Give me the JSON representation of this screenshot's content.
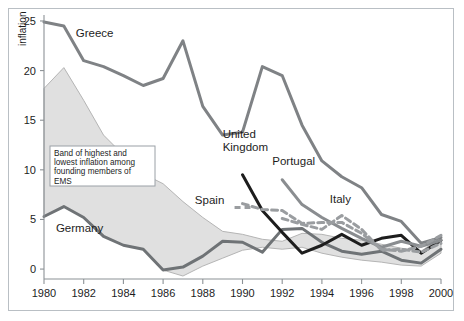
{
  "figure": {
    "background": "#ffffff",
    "frame_color": "#b9bfc4",
    "axis_color": "#8c9296"
  },
  "chart_data": {
    "type": "line",
    "title": "",
    "xlabel": "",
    "ylabel": "inflation",
    "xlim": [
      1980,
      2000
    ],
    "ylim": [
      -1,
      25.5
    ],
    "yticks": [
      0,
      5,
      10,
      15,
      20,
      25
    ],
    "xticks": [
      1980,
      1982,
      1984,
      1986,
      1988,
      1990,
      1992,
      1994,
      1996,
      1998,
      2000
    ],
    "ytick_labels": [
      "0",
      "5",
      "10",
      "15",
      "20",
      "25"
    ],
    "xtick_labels": [
      "1980",
      "1982",
      "1984",
      "1986",
      "1988",
      "1990",
      "1992",
      "1994",
      "1996",
      "1998",
      "2000"
    ],
    "grid": false,
    "legend_position": "inline-annotations",
    "x": [
      1980,
      1981,
      1982,
      1983,
      1984,
      1985,
      1986,
      1987,
      1988,
      1989,
      1990,
      1991,
      1992,
      1993,
      1994,
      1995,
      1996,
      1997,
      1998,
      1999,
      2000
    ],
    "band": {
      "name": "Band of highest and lowest inflation among founding members of EMS",
      "fill": "#e0e0e0",
      "edge": "#b5b5b5",
      "upper": [
        18.2,
        20.3,
        17.0,
        13.5,
        11.5,
        9.6,
        8.6,
        6.8,
        5.2,
        3.8,
        3.5,
        3.0,
        2.8,
        3.6,
        3.5,
        3.1,
        2.9,
        2.5,
        2.1,
        1.8,
        3.2
      ],
      "lower": [
        5.3,
        6.3,
        5.2,
        3.3,
        2.4,
        2.0,
        -0.1,
        -0.7,
        0.3,
        1.1,
        1.9,
        2.2,
        2.0,
        2.2,
        1.6,
        1.2,
        0.9,
        0.7,
        0.4,
        0.3,
        1.6
      ]
    },
    "series": [
      {
        "name": "Greece",
        "style": "solid",
        "color": "#7f8285",
        "width": 3.0,
        "label_x": 1981.6,
        "label_y": 23.4,
        "values": [
          24.9,
          24.5,
          21.0,
          20.4,
          19.5,
          18.5,
          19.2,
          23.0,
          16.4,
          13.5,
          13.8,
          20.4,
          19.5,
          14.5,
          10.9,
          9.3,
          8.2,
          5.5,
          4.8,
          2.6,
          3.2
        ]
      },
      {
        "name": "Germany",
        "style": "solid",
        "color": "#6f7376",
        "width": 3.0,
        "label_x": 1980.6,
        "label_y": 3.7,
        "values": [
          5.3,
          6.3,
          5.2,
          3.3,
          2.4,
          2.0,
          -0.1,
          0.2,
          1.3,
          2.8,
          2.7,
          1.7,
          4.0,
          4.1,
          2.7,
          1.8,
          1.5,
          1.8,
          0.9,
          0.6,
          2.0
        ]
      },
      {
        "name": "United Kingdom",
        "style": "solid",
        "color": "#1d1d1d",
        "width": 3.0,
        "label_x": 1989.0,
        "label_y": 13.2,
        "values": [
          null,
          null,
          null,
          null,
          null,
          null,
          null,
          null,
          null,
          null,
          9.5,
          5.9,
          3.7,
          1.6,
          2.4,
          3.5,
          2.4,
          3.1,
          3.4,
          1.6,
          2.9
        ]
      },
      {
        "name": "Portugal",
        "style": "solid",
        "color": "#8a8d90",
        "width": 3.0,
        "label_x": 1991.5,
        "label_y": 10.5,
        "values": [
          null,
          null,
          null,
          null,
          null,
          null,
          null,
          null,
          null,
          null,
          null,
          null,
          9.0,
          6.5,
          5.2,
          4.1,
          3.1,
          2.2,
          2.8,
          2.3,
          2.9
        ]
      },
      {
        "name": "Spain",
        "style": "dashed",
        "color": "#9a9da0",
        "width": 3.0,
        "label_x": 1987.6,
        "label_y": 6.6,
        "values": [
          null,
          null,
          null,
          null,
          null,
          null,
          null,
          null,
          null,
          null,
          6.6,
          6.0,
          5.9,
          4.6,
          4.7,
          4.7,
          3.6,
          2.0,
          1.8,
          2.3,
          3.4
        ]
      },
      {
        "name": "Italy",
        "style": "dashed",
        "color": "#9a9da0",
        "width": 3.0,
        "label_x": 1994.4,
        "label_y": 6.7,
        "values": [
          null,
          null,
          null,
          null,
          null,
          null,
          null,
          null,
          null,
          null,
          null,
          null,
          5.1,
          4.5,
          4.0,
          5.4,
          4.0,
          1.9,
          2.0,
          1.7,
          2.6
        ]
      }
    ],
    "annotations": [
      {
        "name": "band-note",
        "lines": [
          "Band of highest and",
          "lowest inflation among",
          "founding members of",
          "EMS"
        ],
        "box": true
      }
    ]
  }
}
